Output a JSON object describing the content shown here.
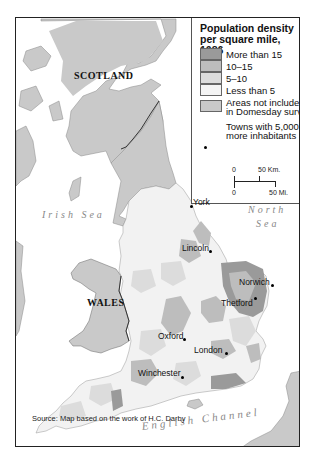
{
  "legend": {
    "title": "Population density per square mile, 1086",
    "items": [
      {
        "label": "More than 15",
        "color": "#9a9a9a"
      },
      {
        "label": "10–15",
        "color": "#bdbdbd"
      },
      {
        "label": "5–10",
        "color": "#dcdcdc"
      },
      {
        "label": "Less than 5",
        "color": "#f4f4f4"
      },
      {
        "label_line1": "Areas not included",
        "label_line2": "in Domesday survey",
        "color": "#c9c9c9"
      }
    ],
    "towns_line1": "Towns with 5,000 or",
    "towns_line2": "more inhabitants",
    "scale": {
      "km_zero": "0",
      "km_label": "50 Km.",
      "mi_zero": "0",
      "mi_label": "50 Mi."
    }
  },
  "labels": {
    "countries": {
      "scotland": "SCOTLAND",
      "wales": "WALES"
    },
    "seas": {
      "irish": "Irish Sea",
      "north_line1": "North",
      "north_line2": "Sea",
      "channel": "English Channel"
    },
    "towns": [
      {
        "name": "York"
      },
      {
        "name": "Lincoln"
      },
      {
        "name": "Norwich"
      },
      {
        "name": "Thetford"
      },
      {
        "name": "Oxford"
      },
      {
        "name": "London"
      },
      {
        "name": "Winchester"
      }
    ]
  },
  "source": "Source: Map based on the work of H.C. Darby"
}
